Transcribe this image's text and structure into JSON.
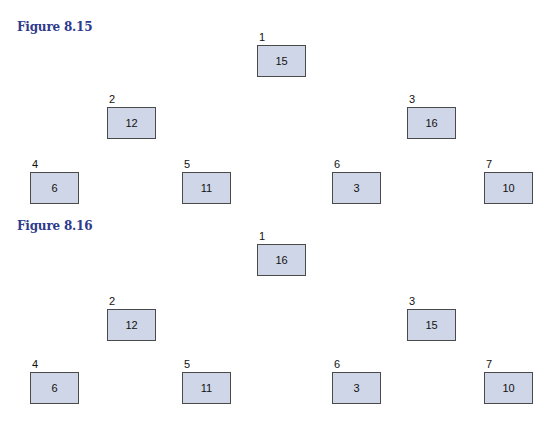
{
  "figures": [
    {
      "title": "Figure 8.15",
      "nodes": [
        {
          "index": "1",
          "value": "15"
        },
        {
          "index": "2",
          "value": "12"
        },
        {
          "index": "3",
          "value": "16"
        },
        {
          "index": "4",
          "value": "6"
        },
        {
          "index": "5",
          "value": "11"
        },
        {
          "index": "6",
          "value": "3"
        },
        {
          "index": "7",
          "value": "10"
        }
      ]
    },
    {
      "title": "Figure 8.16",
      "nodes": [
        {
          "index": "1",
          "value": "16"
        },
        {
          "index": "2",
          "value": "12"
        },
        {
          "index": "3",
          "value": "15"
        },
        {
          "index": "4",
          "value": "6"
        },
        {
          "index": "5",
          "value": "11"
        },
        {
          "index": "6",
          "value": "3"
        },
        {
          "index": "7",
          "value": "10"
        }
      ]
    }
  ],
  "colors": {
    "title": "#2e3a8c",
    "box_fill": "#cfd6e8",
    "box_border": "#4a4a4a"
  }
}
